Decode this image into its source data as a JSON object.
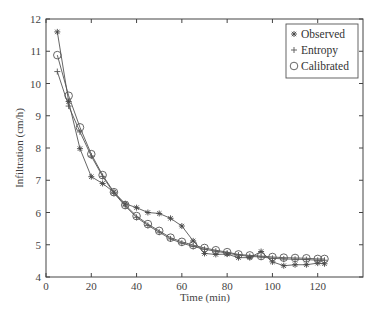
{
  "chart_data": {
    "type": "line",
    "title": "",
    "xlabel": "Time (min)",
    "ylabel": "Infiltration (cm/h)",
    "xlim": [
      0,
      140
    ],
    "ylim": [
      4,
      12
    ],
    "xticks": [
      0,
      20,
      40,
      60,
      80,
      100,
      120
    ],
    "yticks": [
      4,
      5,
      6,
      7,
      8,
      9,
      10,
      11,
      12
    ],
    "grid": false,
    "legend_position": "upper right",
    "series": [
      {
        "name": "Observed",
        "marker": "star",
        "x": [
          5,
          10,
          15,
          20,
          25,
          30,
          35,
          40,
          45,
          50,
          55,
          60,
          65,
          70,
          75,
          80,
          85,
          90,
          95,
          100,
          105,
          110,
          115,
          120,
          123
        ],
        "values": [
          11.6,
          9.44,
          7.98,
          7.11,
          6.9,
          6.63,
          6.27,
          6.15,
          6.0,
          5.97,
          5.82,
          5.58,
          5.12,
          4.73,
          4.7,
          4.71,
          4.6,
          4.6,
          4.79,
          4.47,
          4.35,
          4.38,
          4.38,
          4.43,
          4.41
        ]
      },
      {
        "name": "Entropy",
        "marker": "plus",
        "x": [
          5,
          10,
          15,
          20,
          25,
          30,
          35,
          40,
          45,
          50,
          55,
          60,
          65,
          70,
          75,
          80,
          85,
          90,
          95,
          100,
          105,
          110,
          115,
          120,
          123
        ],
        "values": [
          10.37,
          9.3,
          8.5,
          7.75,
          7.12,
          6.6,
          6.2,
          5.85,
          5.6,
          5.39,
          5.18,
          5.05,
          4.95,
          4.86,
          4.8,
          4.74,
          4.68,
          4.64,
          4.62,
          4.58,
          4.56,
          4.55,
          4.54,
          4.52,
          4.52
        ]
      },
      {
        "name": "Calibrated",
        "marker": "circle",
        "x": [
          5,
          10,
          15,
          20,
          25,
          30,
          35,
          40,
          45,
          50,
          55,
          60,
          65,
          70,
          75,
          80,
          85,
          90,
          95,
          100,
          105,
          110,
          115,
          120,
          123
        ],
        "values": [
          10.88,
          9.62,
          8.64,
          7.81,
          7.16,
          6.63,
          6.23,
          5.89,
          5.64,
          5.43,
          5.22,
          5.09,
          4.99,
          4.9,
          4.83,
          4.77,
          4.7,
          4.67,
          4.65,
          4.62,
          4.6,
          4.59,
          4.58,
          4.56,
          4.56
        ]
      }
    ]
  },
  "colors": {
    "axis": "#444444",
    "line": "#555555",
    "background": "#ffffff"
  }
}
